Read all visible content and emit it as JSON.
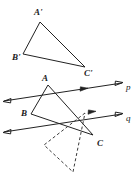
{
  "figure": {
    "type": "geometry-diagram",
    "width": 140,
    "height": 173,
    "background_color": "#ffffff",
    "stroke_color": "#222222",
    "dashed_stroke_color": "#3a3a3a"
  },
  "labels": {
    "a_prime": "A'",
    "b_prime": "B'",
    "c_prime": "C'",
    "a": "A",
    "b": "B",
    "c": "C",
    "line_p": "p",
    "line_q": "q"
  },
  "label_positions": {
    "a_prime": {
      "x": 34,
      "y": 15
    },
    "b_prime": {
      "x": 12,
      "y": 60
    },
    "c_prime": {
      "x": 84,
      "y": 76
    },
    "a": {
      "x": 42,
      "y": 81
    },
    "b": {
      "x": 21,
      "y": 116
    },
    "c": {
      "x": 97,
      "y": 146
    },
    "line_p": {
      "x": 126,
      "y": 90
    },
    "line_q": {
      "x": 126,
      "y": 121
    }
  },
  "chart_data": {
    "type": "scatter",
    "title": "",
    "xlabel": "",
    "ylabel": "",
    "triangles": [
      {
        "name": "image-triangle",
        "style": "solid",
        "vertices": [
          {
            "label": "A'",
            "x": 40,
            "y": 22
          },
          {
            "label": "B'",
            "x": 23,
            "y": 54
          },
          {
            "label": "C'",
            "x": 85,
            "y": 67
          }
        ]
      },
      {
        "name": "preimage-triangle",
        "style": "solid",
        "vertices": [
          {
            "label": "A",
            "x": 48,
            "y": 85
          },
          {
            "label": "B",
            "x": 31,
            "y": 114
          },
          {
            "label": "C",
            "x": 93,
            "y": 135
          }
        ]
      },
      {
        "name": "intermediate-triangle",
        "style": "dashed",
        "vertices": [
          {
            "label": "",
            "x": 85,
            "y": 113
          },
          {
            "label": "",
            "x": 44,
            "y": 145
          },
          {
            "label": "",
            "x": 73,
            "y": 172
          }
        ]
      }
    ],
    "lines": [
      {
        "name": "p",
        "label": "p",
        "style": "solid",
        "double_arrow": true,
        "mid_arrow": true,
        "from": {
          "x": 4,
          "y": 101
        },
        "to": {
          "x": 122,
          "y": 83
        }
      },
      {
        "name": "q",
        "label": "q",
        "style": "solid",
        "double_arrow": true,
        "mid_arrow": true,
        "from": {
          "x": 4,
          "y": 132
        },
        "to": {
          "x": 122,
          "y": 114
        }
      }
    ]
  }
}
